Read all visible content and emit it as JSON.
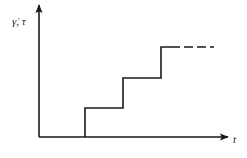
{
  "diagram": {
    "type": "step-function",
    "y_axis_label": "γ̇, τ",
    "x_axis_label": "t",
    "line_color": "#1a1a1a",
    "origin": {
      "x": 39,
      "y": 137
    },
    "steps": [
      {
        "x_start": 85,
        "x_end": 123,
        "level_y": 108
      },
      {
        "x_start": 123,
        "x_end": 161,
        "level_y": 78
      },
      {
        "x_start": 161,
        "x_end": 171,
        "level_y": 47
      }
    ],
    "continuation": {
      "style": "dashed",
      "x_start": 171,
      "x_end": 214,
      "level_y": 47
    }
  }
}
